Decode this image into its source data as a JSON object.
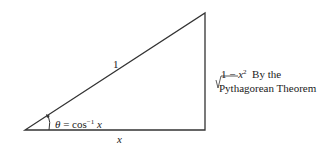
{
  "diagram": {
    "type": "right-triangle",
    "hypotenuse_label": "1",
    "base_label": "x",
    "angle_label": {
      "symbol": "θ",
      "equals": " = cos",
      "exponent": "−1",
      "arg": " x"
    },
    "vertical_side": {
      "radicand_prefix": "1 − ",
      "radicand_var": "x",
      "radicand_exp": "2",
      "note_line1": "By the",
      "note_line2": "Pythagorean Theorem"
    },
    "line_color": "#333333"
  }
}
